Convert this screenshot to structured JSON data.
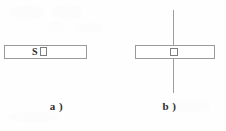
{
  "figure": {
    "background_color": "#fefefe",
    "line_color": "#9a9a9a",
    "text_color": "#2b2b2b",
    "panels": [
      {
        "id": "a",
        "caption": "a )",
        "bar_label": "S",
        "has_axis_line": false,
        "elements": [
          "horizontal-bar",
          "small-square-marker",
          "s-label"
        ]
      },
      {
        "id": "b",
        "caption": "b )",
        "bar_label": "",
        "has_axis_line": true,
        "elements": [
          "horizontal-bar",
          "small-square-marker",
          "vertical-axis-line"
        ]
      }
    ]
  },
  "chart_data": {
    "type": "diagram",
    "title": "",
    "panels": [
      {
        "label": "a )",
        "bar": {
          "x": 4,
          "y": 45,
          "width": 83,
          "height": 14,
          "stroke": "#9a9a9a",
          "fill": "#ffffff"
        },
        "marker": {
          "name": "small-square",
          "x": 40,
          "y": 47,
          "width": 7,
          "height": 9
        },
        "annotation": {
          "text": "S",
          "x": 32,
          "y": 45
        },
        "axis_line": null
      },
      {
        "label": "b )",
        "bar": {
          "x": 135,
          "y": 45,
          "width": 80,
          "height": 14,
          "stroke": "#9a9a9a",
          "fill": "#ffffff"
        },
        "marker": {
          "name": "small-square",
          "x": 170,
          "y": 48,
          "width": 8,
          "height": 8
        },
        "annotation": null,
        "axis_line": {
          "x": 173,
          "y_top": 10,
          "y_bottom": 93,
          "stroke": "#9e9e9e"
        }
      }
    ]
  }
}
